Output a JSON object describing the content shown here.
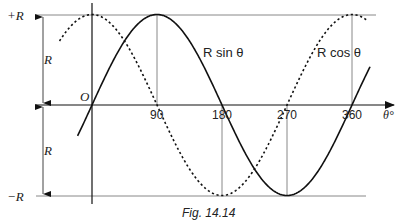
{
  "figure": {
    "caption": "Fig. 14.14",
    "y_labels": {
      "top": "+R",
      "bottom": "−R",
      "upper_span": "R",
      "lower_span": "R",
      "origin": "O"
    },
    "x_axis": {
      "label": "θ°",
      "ticks": [
        "90",
        "180",
        "270",
        "360"
      ]
    },
    "curves": {
      "sin_label": "R sin θ",
      "cos_label": "R cos θ"
    }
  },
  "chart_data": {
    "type": "line",
    "title": "Fig. 14.14",
    "xlabel": "θ°",
    "ylabel": "",
    "x_ticks": [
      90,
      180,
      270,
      360
    ],
    "y_ticks": [
      "+R",
      "−R"
    ],
    "xlim": [
      -45,
      380
    ],
    "ylim": [
      -1,
      1
    ],
    "series": [
      {
        "name": "R sin θ",
        "style": "solid",
        "x": [
          -20,
          0,
          90,
          180,
          270,
          360,
          385
        ],
        "values": [
          -0.34,
          0,
          1,
          0,
          -1,
          0,
          0.42
        ]
      },
      {
        "name": "R cos θ",
        "style": "dashed",
        "x": [
          -45,
          0,
          90,
          180,
          270,
          360,
          380
        ],
        "values": [
          0.71,
          1,
          0,
          -1,
          0,
          1,
          0.94
        ]
      }
    ]
  }
}
